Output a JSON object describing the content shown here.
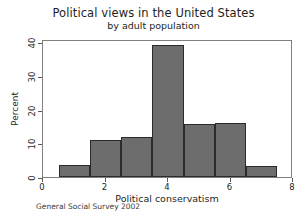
{
  "chart_data": {
    "type": "bar",
    "title": "Political views in the United States",
    "subtitle": "by adult population",
    "xlabel": "Political conservatism",
    "ylabel": "Percent",
    "source_note": "General Social Survey 2002",
    "categories": [
      "1",
      "2",
      "3",
      "4",
      "5",
      "6",
      "7"
    ],
    "values": [
      3.5,
      11.0,
      12.0,
      39.3,
      15.8,
      16.0,
      3.2
    ],
    "bin_edges": [
      0.5,
      1.5,
      2.5,
      3.5,
      4.5,
      5.5,
      6.5,
      7.5
    ],
    "xlim": [
      0,
      8
    ],
    "ylim": [
      0,
      41
    ],
    "xticks": [
      0,
      2,
      4,
      6,
      8
    ],
    "xtick_labels": [
      "0",
      "2",
      "4",
      "6",
      "8"
    ],
    "yticks": [
      0,
      10,
      20,
      30,
      40
    ],
    "ytick_labels": [
      "0",
      "10",
      "20",
      "30",
      "40"
    ],
    "grid": false,
    "legend": "none",
    "bar_color": "#6d6d6d",
    "bar_edge_color": "#2b2b2b",
    "frame_color": "#808080",
    "background_color": "#ffffff"
  }
}
